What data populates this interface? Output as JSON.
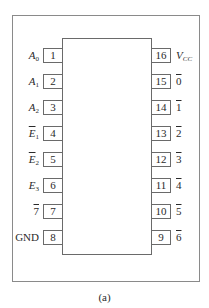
{
  "diagram": {
    "type": "ic-pinout",
    "caption": "(a)",
    "left_pins": [
      {
        "number": "1",
        "name": "A",
        "sub": "0",
        "italic": true,
        "overline": false
      },
      {
        "number": "2",
        "name": "A",
        "sub": "1",
        "italic": true,
        "overline": false
      },
      {
        "number": "3",
        "name": "A",
        "sub": "2",
        "italic": true,
        "overline": false
      },
      {
        "number": "4",
        "name": "E",
        "sub": "1",
        "italic": true,
        "overline": true
      },
      {
        "number": "5",
        "name": "E",
        "sub": "2",
        "italic": true,
        "overline": true
      },
      {
        "number": "6",
        "name": "E",
        "sub": "3",
        "italic": true,
        "overline": false
      },
      {
        "number": "7",
        "name": "7",
        "sub": "",
        "italic": false,
        "overline": true
      },
      {
        "number": "8",
        "name": "GND",
        "sub": "",
        "italic": false,
        "overline": false
      }
    ],
    "right_pins": [
      {
        "number": "16",
        "name": "V",
        "sub": "CC",
        "italic": true,
        "overline": false
      },
      {
        "number": "15",
        "name": "0",
        "sub": "",
        "italic": false,
        "overline": true
      },
      {
        "number": "14",
        "name": "1",
        "sub": "",
        "italic": false,
        "overline": true
      },
      {
        "number": "13",
        "name": "2",
        "sub": "",
        "italic": false,
        "overline": true
      },
      {
        "number": "12",
        "name": "3",
        "sub": "",
        "italic": false,
        "overline": true
      },
      {
        "number": "11",
        "name": "4",
        "sub": "",
        "italic": false,
        "overline": true
      },
      {
        "number": "10",
        "name": "5",
        "sub": "",
        "italic": false,
        "overline": true
      },
      {
        "number": "9",
        "name": "6",
        "sub": "",
        "italic": false,
        "overline": true
      }
    ]
  }
}
